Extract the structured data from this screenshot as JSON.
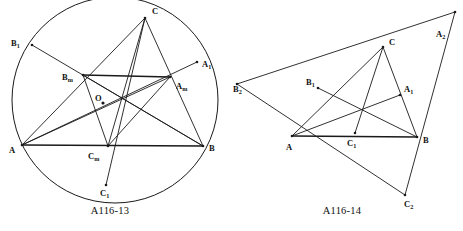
{
  "page": {
    "background_color": "#ffffff",
    "ink_color": "#1a1a1a",
    "width": 463,
    "height": 231
  },
  "figures": [
    {
      "id": "A116-13",
      "caption": "A116-13",
      "caption_position": {
        "x": 110,
        "y": 214
      },
      "type": "circumscribed-circle-triangle",
      "circle": {
        "cx": 115,
        "cy": 100,
        "r": 103
      },
      "center_point": {
        "label": "O",
        "x": 103,
        "y": 103,
        "label_x": 95,
        "label_y": 101,
        "marker": "dot"
      },
      "points": [
        {
          "name": "A",
          "label": "A",
          "sub": "",
          "x": 22,
          "y": 145,
          "label_x": 9,
          "label_y": 153,
          "on_circle": true
        },
        {
          "name": "B",
          "label": "B",
          "sub": "",
          "x": 203,
          "y": 146,
          "label_x": 209,
          "label_y": 151,
          "on_circle": true
        },
        {
          "name": "C",
          "label": "C",
          "sub": "",
          "x": 145,
          "y": 18,
          "label_x": 152,
          "label_y": 14,
          "on_circle": true
        },
        {
          "name": "Am",
          "label": "A",
          "sub": "m",
          "x": 170,
          "y": 77,
          "label_x": 176,
          "label_y": 89,
          "on_circle": false
        },
        {
          "name": "Bm",
          "label": "B",
          "sub": "m",
          "x": 83,
          "y": 75,
          "label_x": 62,
          "label_y": 80,
          "on_circle": false
        },
        {
          "name": "Cm",
          "label": "C",
          "sub": "m",
          "x": 108,
          "y": 146,
          "label_x": 88,
          "label_y": 159,
          "on_circle": false
        },
        {
          "name": "A1",
          "label": "A",
          "sub": "1",
          "x": 197,
          "y": 62,
          "label_x": 202,
          "label_y": 67,
          "on_circle": true
        },
        {
          "name": "B1",
          "label": "B",
          "sub": "1",
          "x": 32,
          "y": 45,
          "label_x": 11,
          "label_y": 46,
          "on_circle": true
        },
        {
          "name": "C1",
          "label": "C",
          "sub": "1",
          "x": 106,
          "y": 185,
          "label_x": 100,
          "label_y": 196,
          "on_circle": true
        }
      ],
      "heavy_segments": [
        {
          "from": "A",
          "to": "B",
          "name": "side-AB"
        },
        {
          "from": "Bm",
          "to": "Am",
          "name": "midline-Bm-Am"
        }
      ],
      "segments": [
        {
          "from": "A",
          "to": "C",
          "name": "side-AC"
        },
        {
          "from": "B",
          "to": "C",
          "name": "side-BC"
        },
        {
          "from": "A",
          "to": "Am",
          "name": "cevian-A-Am"
        },
        {
          "from": "B",
          "to": "Bm",
          "name": "cevian-B-Bm"
        },
        {
          "from": "C",
          "to": "Cm",
          "name": "cevian-C-Cm"
        },
        {
          "from": "A",
          "to": "A1",
          "name": "chord-A-A1"
        },
        {
          "from": "B",
          "to": "B1",
          "name": "chord-B-B1"
        },
        {
          "from": "C",
          "to": "C1",
          "name": "chord-C-C1"
        },
        {
          "from": "Cm",
          "to": "Bm",
          "name": "segment-Cm-Bm"
        },
        {
          "from": "Cm",
          "to": "Am",
          "name": "segment-Cm-Am"
        }
      ]
    },
    {
      "id": "A116-14",
      "caption": "A116-14",
      "caption_position": {
        "x": 342,
        "y": 214
      },
      "type": "triangle-with-external-triangle",
      "points": [
        {
          "name": "A",
          "label": "A",
          "sub": "",
          "x": 292,
          "y": 136,
          "label_x": 286,
          "label_y": 150
        },
        {
          "name": "B",
          "label": "B",
          "sub": "",
          "x": 417,
          "y": 137,
          "label_x": 423,
          "label_y": 143
        },
        {
          "name": "C",
          "label": "C",
          "sub": "",
          "x": 383,
          "y": 47,
          "label_x": 389,
          "label_y": 45
        },
        {
          "name": "A1",
          "label": "A",
          "sub": "1",
          "x": 400,
          "y": 95,
          "label_x": 404,
          "label_y": 92
        },
        {
          "name": "B1",
          "label": "B",
          "sub": "1",
          "x": 318,
          "y": 88,
          "label_x": 306,
          "label_y": 85
        },
        {
          "name": "C1",
          "label": "C",
          "sub": "1",
          "x": 355,
          "y": 133,
          "label_x": 347,
          "label_y": 146
        },
        {
          "name": "A2",
          "label": "A",
          "sub": "2",
          "x": 455,
          "y": 12,
          "label_x": 436,
          "label_y": 37
        },
        {
          "name": "B2",
          "label": "B",
          "sub": "2",
          "x": 237,
          "y": 84,
          "label_x": 233,
          "label_y": 92
        },
        {
          "name": "C2",
          "label": "C",
          "sub": "2",
          "x": 405,
          "y": 195,
          "label_x": 404,
          "label_y": 207
        }
      ],
      "heavy_segments": [
        {
          "from": "A",
          "to": "B",
          "name": "side-AB"
        }
      ],
      "segments": [
        {
          "from": "A",
          "to": "C",
          "name": "side-AC"
        },
        {
          "from": "B",
          "to": "C",
          "name": "side-BC"
        },
        {
          "from": "A",
          "to": "A1",
          "name": "cevian-A-A1"
        },
        {
          "from": "B",
          "to": "B1",
          "name": "cevian-B-B1"
        },
        {
          "from": "C",
          "to": "C1",
          "name": "cevian-C-C1"
        },
        {
          "from": "B2",
          "to": "A2",
          "name": "outer-line-B2-A2"
        },
        {
          "from": "B2",
          "to": "C2",
          "name": "outer-line-B2-C2"
        },
        {
          "from": "A2",
          "to": "C2",
          "name": "outer-line-A2-C2"
        }
      ]
    }
  ]
}
